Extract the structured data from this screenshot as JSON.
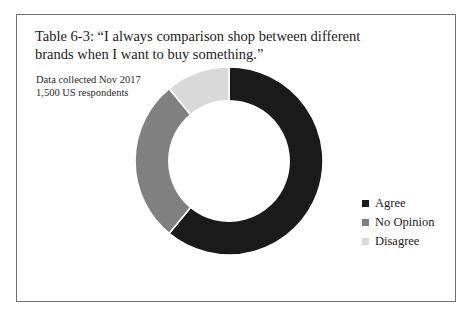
{
  "figure": {
    "title_lines": [
      "Table 6-3: “I always comparison shop between different",
      "brands when I want to buy something.”"
    ],
    "subtitle_lines": [
      "Data collected Nov 2017",
      "1,500 US respondents"
    ],
    "border_color": "#6e6e6e",
    "background_color": "#ffffff"
  },
  "legend": {
    "position": "right",
    "items": [
      {
        "label": "Agree",
        "color": "#1a1a1a"
      },
      {
        "label": "No Opinion",
        "color": "#808080"
      },
      {
        "label": "Disagree",
        "color": "#d9d9d9"
      }
    ]
  },
  "chart_data": {
    "type": "pie",
    "variant": "donut",
    "title": "Table 6-3: “I always comparison shop between different brands when I want to buy something.”",
    "subtitle": "Data collected Nov 2017 / 1,500 US respondents",
    "categories": [
      "Agree",
      "No Opinion",
      "Disagree"
    ],
    "values": [
      61,
      28,
      11
    ],
    "value_unit": "percent",
    "colors": [
      "#1a1a1a",
      "#808080",
      "#d9d9d9"
    ],
    "start_angle_deg": 0,
    "direction": "clockwise",
    "inner_radius_ratio": 0.64,
    "legend_position": "right",
    "data_labels": false,
    "grid": false
  }
}
